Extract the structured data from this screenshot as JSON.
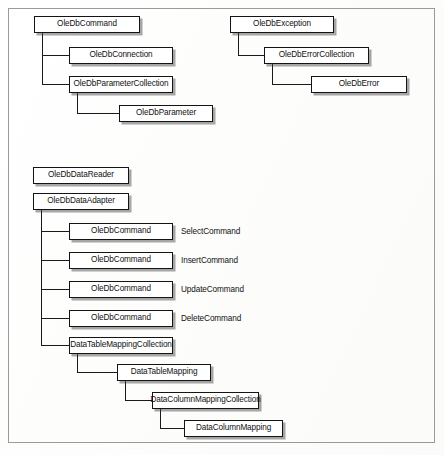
{
  "figure": {
    "width": 444,
    "height": 455,
    "border_color": "#9a9a9a",
    "box_border_color": "#141414",
    "box_fill_color": "#ffffff",
    "text_color": "#111111",
    "shadow_color": "#3c3c3c"
  },
  "trees": [
    {
      "id": "command-tree",
      "root": "OleDbCommand",
      "nodes": [
        {
          "id": "oledbcommand-root",
          "label": "OleDbCommand",
          "level": 0,
          "x": 34,
          "y": 16,
          "w": 106,
          "h": 17
        },
        {
          "id": "oledbconnection",
          "label": "OleDbConnection",
          "level": 1,
          "x": 69,
          "y": 47,
          "w": 104,
          "h": 17
        },
        {
          "id": "oledbparametercollection",
          "label": "OleDbParameterCollection",
          "level": 1,
          "x": 69,
          "y": 76,
          "w": 104,
          "h": 17
        },
        {
          "id": "oledbparameter",
          "label": "OleDbParameter",
          "level": 2,
          "x": 119,
          "y": 105,
          "w": 94,
          "h": 17
        }
      ]
    },
    {
      "id": "exception-tree",
      "root": "OleDbException",
      "nodes": [
        {
          "id": "oledbexception",
          "label": "OleDbException",
          "level": 0,
          "x": 230,
          "y": 16,
          "w": 104,
          "h": 17
        },
        {
          "id": "oledberrorcollection",
          "label": "OleDbErrorCollection",
          "level": 1,
          "x": 264,
          "y": 47,
          "w": 105,
          "h": 17
        },
        {
          "id": "oledberror",
          "label": "OleDbError",
          "level": 2,
          "x": 311,
          "y": 76,
          "w": 96,
          "h": 17
        }
      ]
    },
    {
      "id": "datareader-tree",
      "root": "OleDbDataReader",
      "nodes": [
        {
          "id": "oledbdatareader",
          "label": "OleDbDataReader",
          "level": 0,
          "x": 33,
          "y": 167,
          "w": 96,
          "h": 17
        }
      ]
    },
    {
      "id": "dataadapter-tree",
      "root": "OleDbDataAdapter",
      "nodes": [
        {
          "id": "oledbdataadapter",
          "label": "OleDbDataAdapter",
          "level": 0,
          "x": 33,
          "y": 193,
          "w": 96,
          "h": 17
        },
        {
          "id": "selectcommand-box",
          "label": "OleDbCommand",
          "level": 1,
          "x": 69,
          "y": 223,
          "w": 104,
          "h": 17
        },
        {
          "id": "insertcommand-box",
          "label": "OleDbCommand",
          "level": 1,
          "x": 69,
          "y": 252,
          "w": 104,
          "h": 17
        },
        {
          "id": "updatecommand-box",
          "label": "OleDbCommand",
          "level": 1,
          "x": 69,
          "y": 281,
          "w": 104,
          "h": 17
        },
        {
          "id": "deletecommand-box",
          "label": "OleDbCommand",
          "level": 1,
          "x": 69,
          "y": 310,
          "w": 104,
          "h": 17
        },
        {
          "id": "datatablemappingcollection",
          "label": "DataTableMappingCollection",
          "level": 1,
          "x": 69,
          "y": 337,
          "w": 104,
          "h": 17
        },
        {
          "id": "datatablemapping",
          "label": "DataTableMapping",
          "level": 2,
          "x": 117,
          "y": 364,
          "w": 94,
          "h": 17
        },
        {
          "id": "datacolumnmappingcollection",
          "label": "DataColumnMappingCollection",
          "level": 3,
          "x": 152,
          "y": 392,
          "w": 107,
          "h": 17
        },
        {
          "id": "datacolumnmapping",
          "label": "DataColumnMapping",
          "level": 4,
          "x": 184,
          "y": 420,
          "w": 99,
          "h": 17
        }
      ]
    }
  ],
  "property_labels": [
    {
      "id": "selectcommand-label",
      "text": "SelectCommand",
      "x": 181,
      "y": 228
    },
    {
      "id": "insertcommand-label",
      "text": "InsertCommand",
      "x": 181,
      "y": 257
    },
    {
      "id": "updatecommand-label",
      "text": "UpdateCommand",
      "x": 181,
      "y": 286
    },
    {
      "id": "deletecommand-label",
      "text": "DeleteCommand",
      "x": 181,
      "y": 315
    }
  ],
  "connectors": [
    {
      "id": "c-command-trunk",
      "type": "v",
      "x": 42,
      "y": 33,
      "len": 52
    },
    {
      "id": "c-command-to-connection",
      "type": "h",
      "x": 42,
      "y": 55,
      "len": 27
    },
    {
      "id": "c-command-to-paramcoll",
      "type": "h",
      "x": 42,
      "y": 84,
      "len": 27
    },
    {
      "id": "c-paramcoll-trunk",
      "type": "v",
      "x": 77,
      "y": 93,
      "len": 20
    },
    {
      "id": "c-paramcoll-to-param",
      "type": "h",
      "x": 77,
      "y": 113,
      "len": 42
    },
    {
      "id": "c-exception-trunk",
      "type": "v",
      "x": 238,
      "y": 33,
      "len": 22
    },
    {
      "id": "c-exception-to-errorcoll",
      "type": "h",
      "x": 238,
      "y": 55,
      "len": 26
    },
    {
      "id": "c-errorcoll-trunk",
      "type": "v",
      "x": 272,
      "y": 64,
      "len": 20
    },
    {
      "id": "c-errorcoll-to-error",
      "type": "h",
      "x": 272,
      "y": 84,
      "len": 39
    },
    {
      "id": "c-adapter-trunk",
      "type": "v",
      "x": 41,
      "y": 210,
      "len": 136
    },
    {
      "id": "c-adapter-to-select",
      "type": "h",
      "x": 41,
      "y": 231,
      "len": 28
    },
    {
      "id": "c-adapter-to-insert",
      "type": "h",
      "x": 41,
      "y": 260,
      "len": 28
    },
    {
      "id": "c-adapter-to-update",
      "type": "h",
      "x": 41,
      "y": 289,
      "len": 28
    },
    {
      "id": "c-adapter-to-delete",
      "type": "h",
      "x": 41,
      "y": 318,
      "len": 28
    },
    {
      "id": "c-adapter-to-tablemapcoll",
      "type": "h",
      "x": 41,
      "y": 345,
      "len": 28
    },
    {
      "id": "c-tablemapcoll-trunk",
      "type": "v",
      "x": 77,
      "y": 354,
      "len": 18
    },
    {
      "id": "c-tablemapcoll-to-mapping",
      "type": "h",
      "x": 77,
      "y": 372,
      "len": 40
    },
    {
      "id": "c-tablemapping-trunk",
      "type": "v",
      "x": 125,
      "y": 381,
      "len": 19
    },
    {
      "id": "c-tablemapping-to-colcoll",
      "type": "h",
      "x": 125,
      "y": 400,
      "len": 27
    },
    {
      "id": "c-colcoll-trunk",
      "type": "v",
      "x": 160,
      "y": 409,
      "len": 19
    },
    {
      "id": "c-colcoll-to-colmapping",
      "type": "h",
      "x": 160,
      "y": 428,
      "len": 24
    }
  ]
}
